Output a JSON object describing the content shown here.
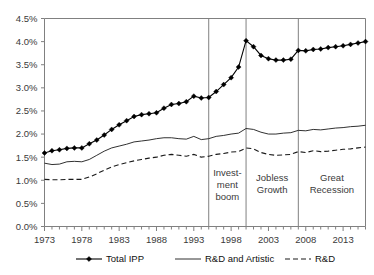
{
  "chart_data": {
    "type": "line",
    "title": "",
    "xlabel": "",
    "ylabel": "",
    "ylim": [
      0.0,
      4.5
    ],
    "xlim": [
      1973,
      2016
    ],
    "ytick_labels": [
      "0.0%",
      "0.5%",
      "1.0%",
      "1.5%",
      "2.0%",
      "2.5%",
      "3.0%",
      "3.5%",
      "4.0%",
      "4.5%"
    ],
    "ytick_values": [
      0.0,
      0.5,
      1.0,
      1.5,
      2.0,
      2.5,
      3.0,
      3.5,
      4.0,
      4.5
    ],
    "xtick_labels": [
      "1973",
      "1978",
      "1983",
      "1988",
      "1993",
      "1998",
      "2003",
      "2008",
      "2013"
    ],
    "xtick_values": [
      1973,
      1978,
      1983,
      1988,
      1993,
      1998,
      2003,
      2008,
      2013
    ],
    "grid": false,
    "legend_position": "bottom",
    "x": [
      1973,
      1974,
      1975,
      1976,
      1977,
      1978,
      1979,
      1980,
      1981,
      1982,
      1983,
      1984,
      1985,
      1986,
      1987,
      1988,
      1989,
      1990,
      1991,
      1992,
      1993,
      1994,
      1995,
      1996,
      1997,
      1998,
      1999,
      2000,
      2001,
      2002,
      2003,
      2004,
      2005,
      2006,
      2007,
      2008,
      2009,
      2010,
      2011,
      2012,
      2013,
      2014,
      2015,
      2016
    ],
    "series": [
      {
        "name": "Total IPP",
        "style": "solid-with-diamond-markers",
        "values": [
          1.59,
          1.64,
          1.66,
          1.69,
          1.7,
          1.7,
          1.79,
          1.87,
          1.98,
          2.1,
          2.2,
          2.29,
          2.38,
          2.42,
          2.44,
          2.46,
          2.56,
          2.64,
          2.66,
          2.7,
          2.82,
          2.78,
          2.79,
          2.92,
          3.07,
          3.22,
          3.45,
          4.02,
          3.89,
          3.7,
          3.63,
          3.6,
          3.6,
          3.62,
          3.81,
          3.8,
          3.83,
          3.84,
          3.87,
          3.89,
          3.91,
          3.94,
          3.97,
          4.0
        ]
      },
      {
        "name": "R&D and Artistic",
        "style": "solid-thin",
        "values": [
          1.37,
          1.34,
          1.35,
          1.4,
          1.41,
          1.4,
          1.45,
          1.54,
          1.63,
          1.7,
          1.74,
          1.78,
          1.83,
          1.85,
          1.87,
          1.9,
          1.92,
          1.92,
          1.9,
          1.89,
          1.95,
          1.88,
          1.9,
          1.95,
          1.97,
          2.0,
          2.02,
          2.12,
          2.1,
          2.04,
          2.0,
          2.0,
          2.02,
          2.03,
          2.08,
          2.07,
          2.1,
          2.09,
          2.11,
          2.13,
          2.14,
          2.16,
          2.17,
          2.19
        ]
      },
      {
        "name": "R&D",
        "style": "dashed",
        "values": [
          1.02,
          1.01,
          1.01,
          1.02,
          1.02,
          1.02,
          1.07,
          1.14,
          1.22,
          1.29,
          1.34,
          1.38,
          1.42,
          1.45,
          1.48,
          1.5,
          1.54,
          1.56,
          1.54,
          1.52,
          1.56,
          1.5,
          1.52,
          1.56,
          1.58,
          1.61,
          1.62,
          1.7,
          1.68,
          1.6,
          1.56,
          1.54,
          1.55,
          1.56,
          1.62,
          1.6,
          1.64,
          1.62,
          1.63,
          1.65,
          1.67,
          1.68,
          1.7,
          1.72
        ]
      }
    ],
    "annotations": [
      {
        "label": "Invest-\nment\nboom",
        "lines": [
          "Invest-",
          "ment",
          "boom"
        ],
        "start": 1995,
        "end": 2000
      },
      {
        "label": "Jobless\nGrowth",
        "lines": [
          "Jobless",
          "Growth"
        ],
        "start": 2000,
        "end": 2007
      },
      {
        "label": "Great\nRecession",
        "lines": [
          "Great",
          "Recession"
        ],
        "start": 2007,
        "end": 2016
      }
    ],
    "divider_years": [
      1995,
      2000,
      2007
    ],
    "colors": {
      "total_ipp": "#000000",
      "rd_and_artistic": "#1a1a1a",
      "rd": "#1a1a1a",
      "axis": "#808080",
      "text": "#3a3a3a",
      "background": "#ffffff"
    }
  },
  "legend": {
    "items": [
      {
        "label": "Total IPP",
        "key": "legend-item-total-ipp"
      },
      {
        "label": "R&D and Artistic",
        "key": "legend-item-rd-and-artistic"
      },
      {
        "label": "R&D",
        "key": "legend-item-rd"
      }
    ]
  }
}
